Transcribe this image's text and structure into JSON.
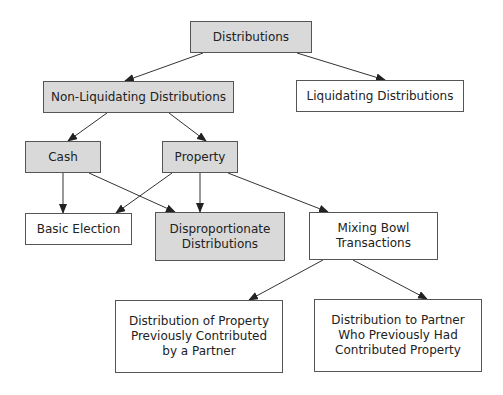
{
  "nodes": {
    "distributions": {
      "label": "Distributions",
      "shaded": true
    },
    "non_liquidating": {
      "label": "Non-Liquidating Distributions",
      "shaded": true
    },
    "liquidating": {
      "label": "Liquidating Distributions",
      "shaded": false
    },
    "cash": {
      "label": "Cash",
      "shaded": true
    },
    "property": {
      "label": "Property",
      "shaded": true
    },
    "basic_election": {
      "label": "Basic Election",
      "shaded": false
    },
    "disproportionate": {
      "label": "Disproportionate\nDistributions",
      "shaded": true
    },
    "mixing_bowl": {
      "label": "Mixing Bowl\nTransactions",
      "shaded": false
    },
    "dist_of_property": {
      "label": "Distribution of Property\nPreviously Contributed\nby a Partner",
      "shaded": false
    },
    "dist_to_partner": {
      "label": "Distribution to Partner\nWho Previously Had\nContributed Property",
      "shaded": false
    }
  },
  "edges": [
    [
      "distributions",
      "non_liquidating"
    ],
    [
      "distributions",
      "liquidating"
    ],
    [
      "non_liquidating",
      "cash"
    ],
    [
      "non_liquidating",
      "property"
    ],
    [
      "cash",
      "basic_election"
    ],
    [
      "cash",
      "disproportionate"
    ],
    [
      "property",
      "basic_election"
    ],
    [
      "property",
      "disproportionate"
    ],
    [
      "property",
      "mixing_bowl"
    ],
    [
      "mixing_bowl",
      "dist_of_property"
    ],
    [
      "mixing_bowl",
      "dist_to_partner"
    ]
  ]
}
